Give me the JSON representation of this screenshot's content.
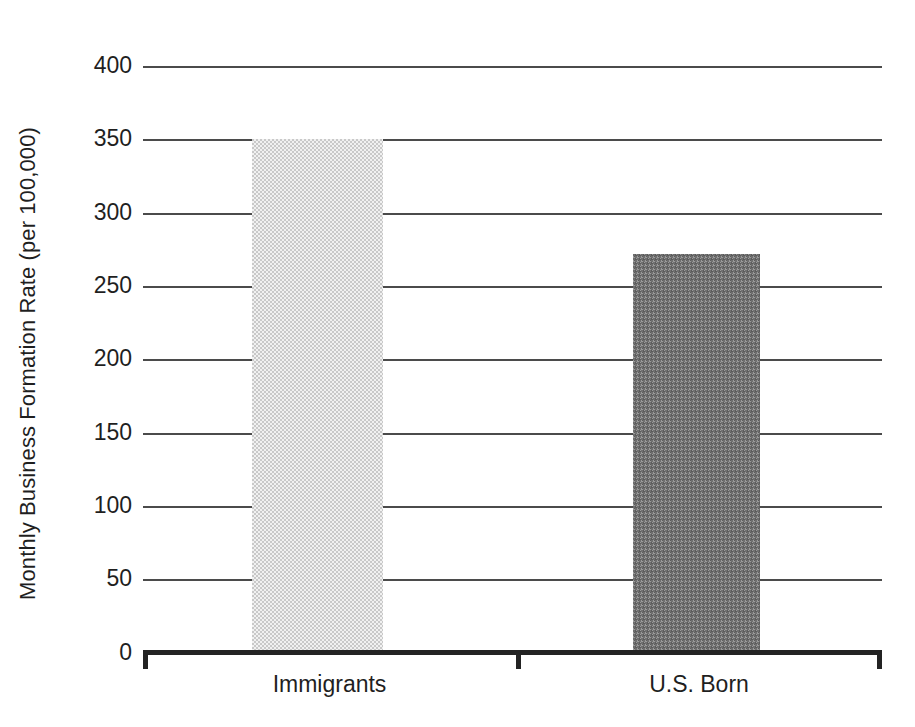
{
  "chart_data": {
    "type": "bar",
    "title": "",
    "xlabel": "",
    "ylabel": "Monthly Business Formation Rate (per 100,000)",
    "categories": [
      "Immigrants",
      "U.S. Born"
    ],
    "values": [
      350,
      272
    ],
    "series": [
      {
        "name": "Monthly Business Formation Rate",
        "values": [
          350,
          272
        ]
      }
    ],
    "ylim": [
      0,
      400
    ],
    "ytick_labels": [
      "400",
      "350",
      "300",
      "250",
      "200",
      "150",
      "100",
      "50",
      "0"
    ],
    "ytick_values": [
      400,
      350,
      300,
      250,
      200,
      150,
      100,
      50,
      0
    ],
    "grid": true,
    "grid_axis": "y",
    "legend": false,
    "legend_position": "none",
    "bar_colors": [
      "#c9c9c9",
      "#6f6f6f"
    ],
    "axis_color": "#232323",
    "gridline_color": "#4b4b4b",
    "background_color": "#ffffff"
  }
}
